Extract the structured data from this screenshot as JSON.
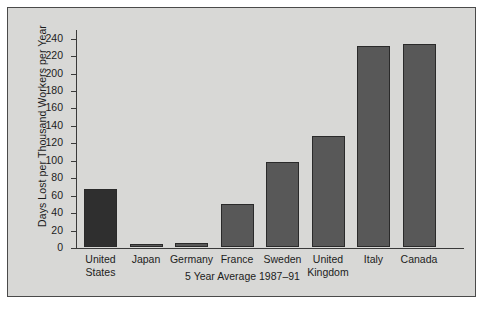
{
  "chart_data": {
    "type": "bar",
    "title": "",
    "xlabel": "5 Year Average 1987–91",
    "ylabel": "Days Lost per Thousand Workers per Year",
    "ylim": [
      0,
      250
    ],
    "ytick_step": 20,
    "yticks": [
      0,
      20,
      40,
      60,
      80,
      100,
      120,
      140,
      160,
      180,
      200,
      220,
      240
    ],
    "grid": false,
    "legend": false,
    "categories": [
      "United States",
      "Japan",
      "Germany",
      "France",
      "Sweden",
      "United Kingdom",
      "Italy",
      "Canada"
    ],
    "category_lines": [
      [
        "United",
        "States"
      ],
      [
        "Japan"
      ],
      [
        "Germany"
      ],
      [
        "France"
      ],
      [
        "Sweden"
      ],
      [
        "United",
        "Kingdom"
      ],
      [
        "Italy"
      ],
      [
        "Canada"
      ]
    ],
    "values": [
      66,
      3,
      5,
      49,
      98,
      127,
      231,
      233
    ],
    "bar_colors": [
      "#2f2f2f",
      "#585858",
      "#585858",
      "#585858",
      "#585858",
      "#585858",
      "#585858",
      "#585858"
    ]
  },
  "figure": {
    "background_color": "#d8d8d6",
    "frame_color": "#4a4a4a",
    "axis_color": "#3a3a3a",
    "text_color": "#1c1c1c"
  }
}
